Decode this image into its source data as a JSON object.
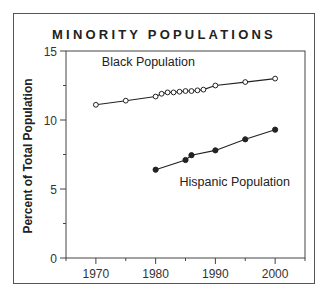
{
  "chart_data": {
    "type": "line",
    "title": "MINORITY POPULATIONS",
    "xlabel": "",
    "ylabel": "Percent of Total Population",
    "xlim": [
      1965,
      2005
    ],
    "ylim": [
      0,
      15
    ],
    "x_ticks": [
      1970,
      1980,
      1990,
      2000
    ],
    "x_minor_ticks": [
      1965,
      1975,
      1985,
      1995,
      2005
    ],
    "y_ticks": [
      0,
      5,
      10,
      15
    ],
    "y_minor_ticks": [
      2.5,
      7.5,
      12.5
    ],
    "grid": false,
    "legend": "inline labels",
    "series": [
      {
        "name": "Black Population",
        "marker": "open-circle",
        "x": [
          1970,
          1975,
          1980,
          1981,
          1982,
          1983,
          1984,
          1985,
          1986,
          1987,
          1988,
          1990,
          1995,
          2000
        ],
        "values": [
          11.1,
          11.4,
          11.7,
          11.9,
          12.0,
          12.0,
          12.05,
          12.1,
          12.1,
          12.15,
          12.2,
          12.5,
          12.75,
          13.0
        ],
        "label_position": {
          "x": 1971,
          "y": 13.9
        }
      },
      {
        "name": "Hispanic Population",
        "marker": "filled-circle",
        "x": [
          1980,
          1985,
          1986,
          1990,
          1995,
          2000
        ],
        "values": [
          6.4,
          7.1,
          7.45,
          7.8,
          8.6,
          9.3
        ],
        "label_position": {
          "x": 1984,
          "y": 5.2
        }
      }
    ]
  },
  "labels": {
    "title": "MINORITY POPULATIONS",
    "ylabel": "Percent of Total Population"
  },
  "colors": {
    "line": "#222222",
    "frame": "#555555",
    "text": "#222222"
  }
}
